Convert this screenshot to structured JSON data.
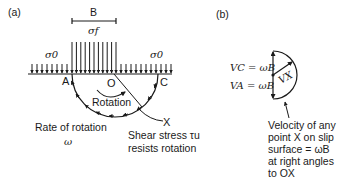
{
  "panel_a": {
    "tag": "(a)",
    "width_label": "B",
    "footing_stress_label": "σf",
    "surcharge_left_label": "σ0",
    "surcharge_right_label": "σ0",
    "point_a": "A",
    "point_o": "O",
    "point_c": "C",
    "point_x": "X",
    "rotation_label": "Rotation",
    "rate_label": "Rate of rotation",
    "rate_symbol": "ω",
    "shear_label_line1": "Shear stress τu",
    "shear_label_line2": "resists rotation"
  },
  "panel_b": {
    "tag": "(b)",
    "vc_label": "VC = ωB",
    "va_label": "VA = ωB",
    "vx_label": "VX",
    "note_lines": [
      "Velocity of any",
      "point X on slip",
      "surface = ωB",
      "at right angles",
      "to OX"
    ]
  },
  "colors": {
    "ink": "#1a1a1a",
    "background": "#ffffff"
  }
}
